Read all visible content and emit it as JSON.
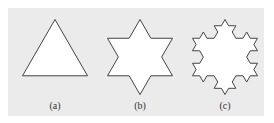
{
  "figure": {
    "background_color": "#ebebeb",
    "stroke_color": "#444444",
    "fill_color": "#ffffff",
    "panels": [
      {
        "label": "(a)",
        "iteration": 0,
        "center_x": 55
      },
      {
        "label": "(b)",
        "iteration": 1,
        "center_x": 140
      },
      {
        "label": "(c)",
        "iteration": 2,
        "center_x": 225
      }
    ]
  }
}
